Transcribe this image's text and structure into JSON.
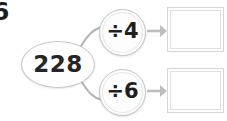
{
  "worksheet": {
    "question_number": "6",
    "start_value": "228",
    "operations": [
      {
        "id": "divide-by-4",
        "label": "÷4",
        "operator": "÷",
        "operand": "4"
      },
      {
        "id": "divide-by-6",
        "label": "÷6",
        "operator": "÷",
        "operand": "6"
      }
    ],
    "answers": [
      {
        "id": "answer-1",
        "value": "",
        "placeholder": ""
      },
      {
        "id": "answer-2",
        "value": "",
        "placeholder": ""
      }
    ],
    "arrows": [
      {
        "id": "arrow-to-answer-1",
        "icon": "arrow-right-icon"
      },
      {
        "id": "arrow-to-answer-2",
        "icon": "arrow-right-icon"
      }
    ],
    "connectors": [
      {
        "id": "connector-start-to-divide-by-4"
      },
      {
        "id": "connector-start-to-divide-by-6"
      }
    ],
    "colors": {
      "background": "#ffffff",
      "node_stroke": "#c7c7c7",
      "wire": "#b5b5b5",
      "arrow": "#bdbdbd",
      "text": "#1f1f1f",
      "box_border": "#d6d6d6"
    }
  }
}
